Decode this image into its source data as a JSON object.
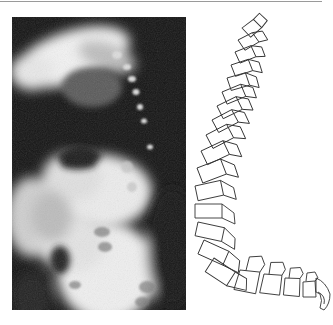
{
  "figure": {
    "left_panel": {
      "type": "radiograph",
      "description": "Lateral X-ray of a curved spine",
      "background_color": "#141414"
    },
    "right_panel": {
      "type": "line-drawing",
      "description": "Schematic outline of curved vertebral column",
      "stroke_color": "#333333",
      "vertebra_count": 26
    },
    "top_rule_color": "#9a9a9a"
  }
}
